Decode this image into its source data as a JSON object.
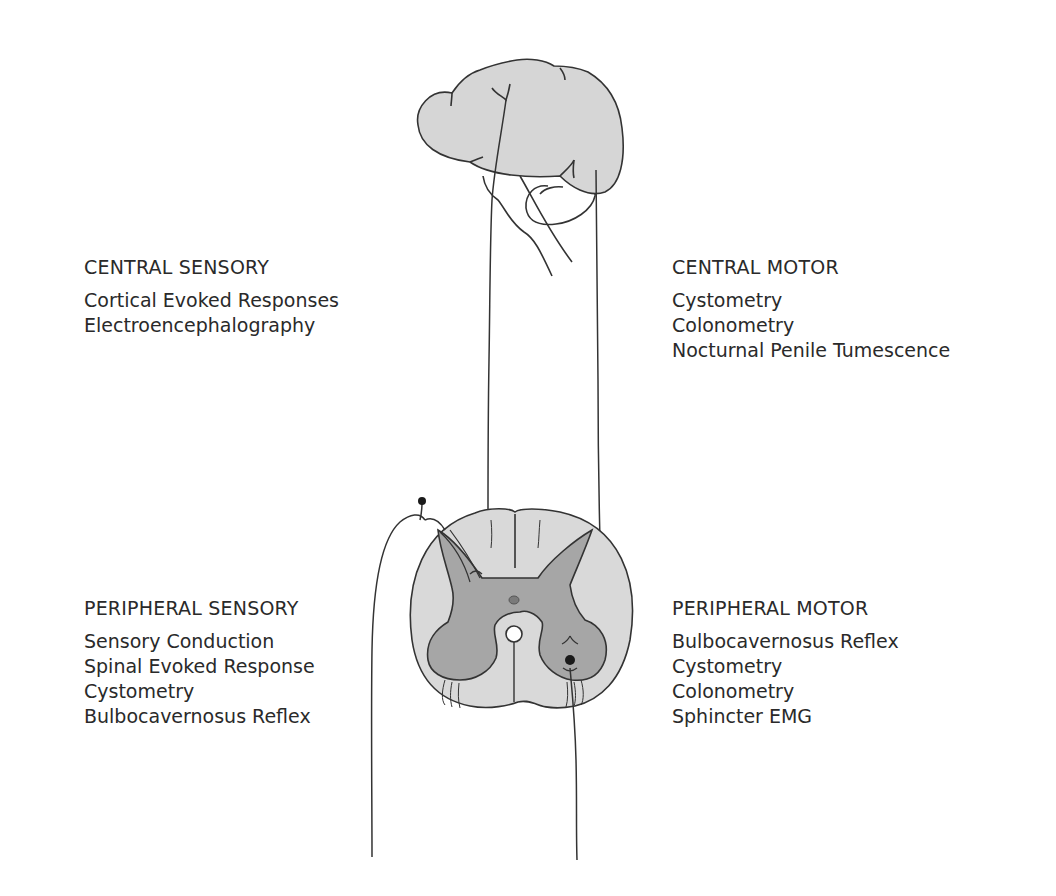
{
  "diagram": {
    "colors": {
      "line": "#333333",
      "brain_fill": "#d6d6d6",
      "white_matter_fill": "#d9d9d9",
      "gray_matter_fill": "#a6a6a6",
      "central_canal_fill": "#ffffff",
      "neuron_dot": "#1a1a1a",
      "text": "#2a2a2a"
    },
    "structures": [
      {
        "name": "brain",
        "label": "Brain (lateral view with brainstem and cerebellum)"
      },
      {
        "name": "spinal-cord",
        "label": "Spinal cord cross-section"
      },
      {
        "name": "sensory-nerve",
        "label": "Afferent sensory pathway with dorsal root ganglion"
      },
      {
        "name": "motor-nerve",
        "label": "Efferent motor pathway from ventral horn"
      }
    ]
  },
  "groups": {
    "central_sensory": {
      "title": "CENTRAL SENSORY",
      "items": [
        "Cortical Evoked Responses",
        "Electroencephalography"
      ]
    },
    "central_motor": {
      "title": "CENTRAL MOTOR",
      "items": [
        "Cystometry",
        "Colonometry",
        "Nocturnal Penile Tumescence"
      ]
    },
    "peripheral_sensory": {
      "title": "PERIPHERAL SENSORY",
      "items": [
        "Sensory Conduction",
        "Spinal Evoked Response",
        "Cystometry",
        "Bulbocavernosus Reflex"
      ]
    },
    "peripheral_motor": {
      "title": "PERIPHERAL MOTOR",
      "items": [
        "Bulbocavernosus Reflex",
        "Cystometry",
        "Colonometry",
        "Sphincter EMG"
      ]
    }
  }
}
